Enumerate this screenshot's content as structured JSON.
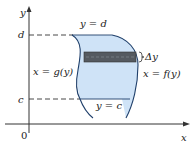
{
  "diagram": {
    "type": "region-between-curves-horizontal-strip",
    "labels": {
      "y_axis": "y",
      "x_axis": "x",
      "origin": "0",
      "d_tick": "d",
      "c_tick": "c",
      "top_boundary": "y = d",
      "bottom_boundary": "y = c",
      "left_curve": "x = g(y)",
      "right_curve": "x = f(y)",
      "strip_height": "Δy"
    },
    "colors": {
      "region_fill": "#cfe3f7",
      "region_stroke": "#1f3f6a",
      "strip_fill": "#555a60",
      "axis": "#333333",
      "dashed": "#333333",
      "text": "#222222"
    }
  }
}
